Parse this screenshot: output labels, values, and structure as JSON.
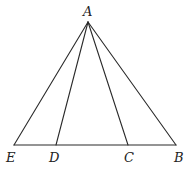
{
  "diagram": {
    "type": "geometry-triangle",
    "points": {
      "A": {
        "label": "A",
        "x": 88,
        "y": 22
      },
      "B": {
        "label": "B",
        "x": 176,
        "y": 145
      },
      "C": {
        "label": "C",
        "x": 128,
        "y": 145
      },
      "D": {
        "label": "D",
        "x": 56,
        "y": 145
      },
      "E": {
        "label": "E",
        "x": 14,
        "y": 145
      }
    },
    "segments": [
      [
        "A",
        "E"
      ],
      [
        "A",
        "D"
      ],
      [
        "A",
        "C"
      ],
      [
        "A",
        "B"
      ],
      [
        "E",
        "B"
      ]
    ],
    "labels": {
      "A": "A",
      "B": "B",
      "C": "C",
      "D": "D",
      "E": "E"
    },
    "colors": {
      "line": "#2a2a2a",
      "text": "#222222",
      "background": "#ffffff"
    }
  }
}
